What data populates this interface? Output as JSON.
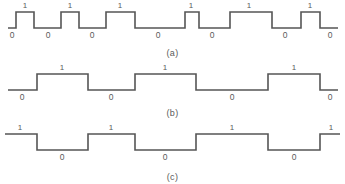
{
  "figure": {
    "stroke_color": "#555555",
    "label_color": "#5a5a5a",
    "background_color": "#ffffff",
    "symbol_one": "1",
    "symbol_zero": "0"
  },
  "waveforms": [
    {
      "id": "a",
      "caption": "(a)",
      "scheme": "return-to-zero",
      "baseline_y": 28,
      "high_y": 12,
      "start_x": 8,
      "end_x": 338,
      "segments": [
        {
          "level": 0,
          "x0": 8,
          "x1": 16,
          "label": "0",
          "label_x": 12
        },
        {
          "level": 1,
          "x0": 16,
          "x1": 34,
          "label": "1",
          "label_x": 25
        },
        {
          "level": 0,
          "x0": 34,
          "x1": 61,
          "label": "0",
          "label_x": 48
        },
        {
          "level": 1,
          "x0": 61,
          "x1": 79,
          "label": "1",
          "label_x": 70
        },
        {
          "level": 0,
          "x0": 79,
          "x1": 106,
          "label": "0",
          "label_x": 92
        },
        {
          "level": 1,
          "x0": 106,
          "x1": 135,
          "label": "1",
          "label_x": 120
        },
        {
          "level": 0,
          "x0": 135,
          "x1": 185,
          "label": "0",
          "label_x": 158
        },
        {
          "level": 1,
          "x0": 185,
          "x1": 199,
          "label": "1",
          "label_x": 191
        },
        {
          "level": 0,
          "x0": 199,
          "x1": 230,
          "label": "0",
          "label_x": 212
        },
        {
          "level": 1,
          "x0": 230,
          "x1": 272,
          "label": "1",
          "label_x": 249
        },
        {
          "level": 0,
          "x0": 272,
          "x1": 301,
          "label": "0",
          "label_x": 285
        },
        {
          "level": 1,
          "x0": 301,
          "x1": 320,
          "label": "1",
          "label_x": 310
        },
        {
          "level": 0,
          "x0": 320,
          "x1": 338,
          "label": "0",
          "label_x": 330
        }
      ],
      "bits": [
        "0",
        "1",
        "0",
        "1",
        "0",
        "1",
        "0",
        "1",
        "0",
        "1",
        "0",
        "1",
        "0"
      ]
    },
    {
      "id": "b",
      "caption": "(b)",
      "scheme": "non-return-to-zero-level",
      "baseline_y": 30,
      "high_y": 14,
      "start_x": 8,
      "end_x": 338,
      "segments": [
        {
          "level": 0,
          "x0": 8,
          "x1": 37,
          "label": "0",
          "label_x": 22
        },
        {
          "level": 1,
          "x0": 37,
          "x1": 88,
          "label": "1",
          "label_x": 62
        },
        {
          "level": 0,
          "x0": 88,
          "x1": 135,
          "label": "0",
          "label_x": 111
        },
        {
          "level": 1,
          "x0": 135,
          "x1": 196,
          "label": "1",
          "label_x": 165
        },
        {
          "level": 0,
          "x0": 196,
          "x1": 268,
          "label": "0",
          "label_x": 232
        },
        {
          "level": 1,
          "x0": 268,
          "x1": 320,
          "label": "1",
          "label_x": 294
        },
        {
          "level": 0,
          "x0": 320,
          "x1": 338,
          "label": "0",
          "label_x": 330
        }
      ],
      "bits": [
        "0",
        "1",
        "0",
        "1",
        "0",
        "1",
        "0"
      ]
    },
    {
      "id": "c",
      "caption": "(c)",
      "scheme": "non-return-to-zero-inverted",
      "baseline_y": 30,
      "high_y": 14,
      "start_x": 5,
      "end_x": 340,
      "segments": [
        {
          "level": 1,
          "x0": 5,
          "x1": 37,
          "label": "1",
          "label_x": 20
        },
        {
          "level": 0,
          "x0": 37,
          "x1": 88,
          "label": "0",
          "label_x": 62
        },
        {
          "level": 1,
          "x0": 88,
          "x1": 135,
          "label": "1",
          "label_x": 111
        },
        {
          "level": 0,
          "x0": 135,
          "x1": 196,
          "label": "0",
          "label_x": 165
        },
        {
          "level": 1,
          "x0": 196,
          "x1": 268,
          "label": "1",
          "label_x": 232
        },
        {
          "level": 0,
          "x0": 268,
          "x1": 320,
          "label": "0",
          "label_x": 294
        },
        {
          "level": 1,
          "x0": 320,
          "x1": 340,
          "label": "1",
          "label_x": 331
        }
      ],
      "bits": [
        "1",
        "0",
        "1",
        "0",
        "1",
        "0",
        "1"
      ]
    }
  ],
  "captions": {
    "a": "(a)",
    "b": "(b)",
    "c": "(c)"
  },
  "caption_positions": {
    "a": 48,
    "b": 108,
    "c": 172
  }
}
